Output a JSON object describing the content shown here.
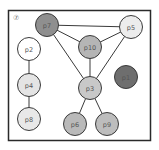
{
  "diagram": {
    "corner_label": "⑦",
    "nodes": [
      {
        "id": "p7",
        "label": "p7",
        "fill": "#8f8f8f",
        "shade": "dark"
      },
      {
        "id": "p5",
        "label": "p5",
        "fill": "#ececec",
        "shade": "light"
      },
      {
        "id": "p10",
        "label": "p10",
        "fill": "#b5b5b5",
        "shade": "medium"
      },
      {
        "id": "p2",
        "label": "p2",
        "fill": "#ffffff",
        "shade": "white"
      },
      {
        "id": "p1",
        "label": "p1",
        "fill": "#6e6e6e",
        "shade": "darkest"
      },
      {
        "id": "p3",
        "label": "p3",
        "fill": "#c8c8c8",
        "shade": "medium-light"
      },
      {
        "id": "p4",
        "label": "p4",
        "fill": "#e4e4e4",
        "shade": "light"
      },
      {
        "id": "p8",
        "label": "p8",
        "fill": "#e8e8e8",
        "shade": "light"
      },
      {
        "id": "p6",
        "label": "p6",
        "fill": "#b9b9b9",
        "shade": "medium"
      },
      {
        "id": "p9",
        "label": "p9",
        "fill": "#bdbdbd",
        "shade": "medium"
      }
    ],
    "edges": [
      [
        "p7",
        "p5"
      ],
      [
        "p7",
        "p10"
      ],
      [
        "p7",
        "p3"
      ],
      [
        "p10",
        "p5"
      ],
      [
        "p10",
        "p3"
      ],
      [
        "p5",
        "p3"
      ],
      [
        "p3",
        "p6"
      ],
      [
        "p3",
        "p9"
      ],
      [
        "p2",
        "p4"
      ],
      [
        "p4",
        "p8"
      ]
    ]
  }
}
